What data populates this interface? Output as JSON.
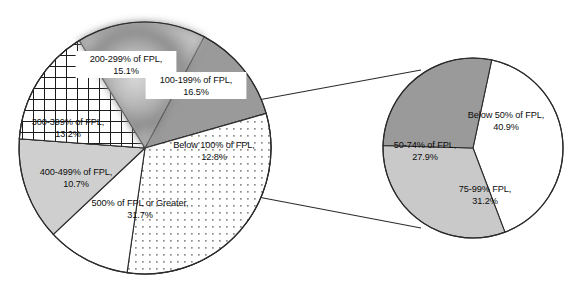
{
  "figure": {
    "title": "",
    "background_color": "#ffffff",
    "outline_color": "#2b2b2b"
  },
  "chart_data": {
    "type": "pie",
    "title": "",
    "subtitle": "",
    "xlabel": "",
    "ylabel": "",
    "legend_position": "none",
    "grid": false,
    "charts": [
      {
        "name": "main-pie",
        "description": "Distribution by percent of Federal Poverty Level (FPL)",
        "center": [
          145,
          148
        ],
        "radius": 126,
        "start_angle_deg": -62,
        "categories": [
          "Below 100% of FPL",
          "500% of FPL or Greater",
          "400-499% of FPL",
          "300-399% of FPL",
          "200-299% of FPL",
          "100-199% of FPL"
        ],
        "values": [
          12.8,
          31.7,
          10.7,
          13.2,
          15.1,
          16.5
        ],
        "slices": [
          {
            "label": "Below 100% of FPL,",
            "value_label": "12.8%",
            "value": 12.8,
            "fill": "#9a9a9a",
            "pattern": "solid",
            "label_x": 214,
            "label_y": 148,
            "label_boxed": false
          },
          {
            "label": "500% of FPL or Greater,",
            "value_label": "31.7%",
            "value": 31.7,
            "fill": "#ffffff",
            "pattern": "dots",
            "label_x": 140,
            "label_y": 206,
            "label_boxed": false
          },
          {
            "label": "400-499% of FPL,",
            "value_label": "10.7%",
            "value": 10.7,
            "fill": "#ffffff",
            "pattern": "solid",
            "label_x": 76,
            "label_y": 175,
            "label_boxed": false
          },
          {
            "label": "300-399% of FPL,",
            "value_label": "13.2%",
            "value": 13.2,
            "fill": "#cfcfcf",
            "pattern": "solid",
            "label_x": 68,
            "label_y": 125,
            "label_boxed": false
          },
          {
            "label": "200-299% of FPL,",
            "value_label": "15.1%",
            "value": 15.1,
            "fill": "#ffffff",
            "pattern": "grid",
            "label_x": 126,
            "label_y": 62,
            "label_boxed": true
          },
          {
            "label": "100-199% of FPL,",
            "value_label": "16.5%",
            "value": 16.5,
            "fill": "#b5b5b5",
            "pattern": "mottled",
            "label_x": 196,
            "label_y": 83,
            "label_boxed": true
          }
        ]
      },
      {
        "name": "exploded-pie",
        "description": "Breakout of the Below 100% of FPL group",
        "center": [
          473,
          148
        ],
        "radius": 90,
        "start_angle_deg": -78,
        "categories": [
          "Below 50% of FPL",
          "75-99% FPL",
          "50-74% of FPL"
        ],
        "values": [
          40.9,
          31.2,
          27.9
        ],
        "slices": [
          {
            "label": "Below 50% of FPL,",
            "value_label": "40.9%",
            "value": 40.9,
            "fill": "#ffffff",
            "pattern": "solid",
            "label_x": 506,
            "label_y": 118,
            "label_boxed": false
          },
          {
            "label": "75-99% FPL,",
            "value_label": "31.2%",
            "value": 31.2,
            "fill": "#c9c9c9",
            "pattern": "solid",
            "label_x": 485,
            "label_y": 192,
            "label_boxed": false
          },
          {
            "label": "50-74% of FPL,",
            "value_label": "27.9%",
            "value": 27.9,
            "fill": "#9a9a9a",
            "pattern": "solid",
            "label_x": 425,
            "label_y": 148,
            "label_boxed": false
          }
        ]
      }
    ],
    "connectors": [
      {
        "name": "upper-callout-line",
        "x1": 258,
        "y1": 100,
        "x2": 421,
        "y2": 70
      },
      {
        "name": "lower-callout-line",
        "x1": 258,
        "y1": 197,
        "x2": 421,
        "y2": 228
      }
    ]
  }
}
